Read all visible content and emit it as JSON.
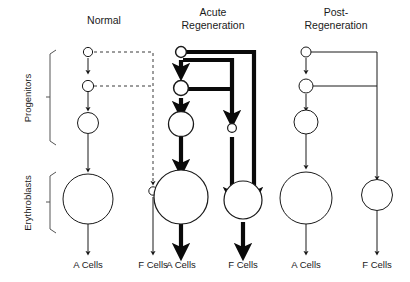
{
  "figure": {
    "title_text": "Erythroid progenitor lineage model",
    "width": 410,
    "height": 282,
    "ink_color": "#1a1a1a",
    "thick_color": "#0a0a0a",
    "dash_color": "#3a3a3a"
  },
  "row_labels": [
    {
      "id": "progenitors",
      "label": "Progenitors"
    },
    {
      "id": "erythroblasts",
      "label": "Erythroblasts"
    }
  ],
  "columns": [
    {
      "id": "normal",
      "header": "Normal",
      "header_lines": [
        "Normal"
      ],
      "line_style": "dashed-branch",
      "a_cells_label": "A Cells",
      "f_cells_label": "F Cells",
      "f_cell_size": "small"
    },
    {
      "id": "acute-regeneration",
      "header": "Acute Regeneration",
      "header_lines": [
        "Acute",
        "Regeneration"
      ],
      "line_style": "thick-solid",
      "a_cells_label": "A Cells",
      "f_cells_label": "F Cells",
      "f_cell_size": "medium"
    },
    {
      "id": "post-regeneration",
      "header": "Post-Regeneration",
      "header_lines": [
        "Post-",
        "Regeneration"
      ],
      "line_style": "thin-solid",
      "a_cells_label": "A Cells",
      "f_cells_label": "F Cells",
      "f_cell_size": "small-medium"
    }
  ],
  "cell_stages": [
    {
      "id": "stage-1",
      "name": "earliest-progenitor",
      "relative_size": "tiny"
    },
    {
      "id": "stage-2",
      "name": "intermediate-progenitor",
      "relative_size": "tiny"
    },
    {
      "id": "stage-3",
      "name": "late-progenitor",
      "relative_size": "small"
    },
    {
      "id": "stage-4",
      "name": "erythroblast",
      "relative_size": "large"
    }
  ]
}
